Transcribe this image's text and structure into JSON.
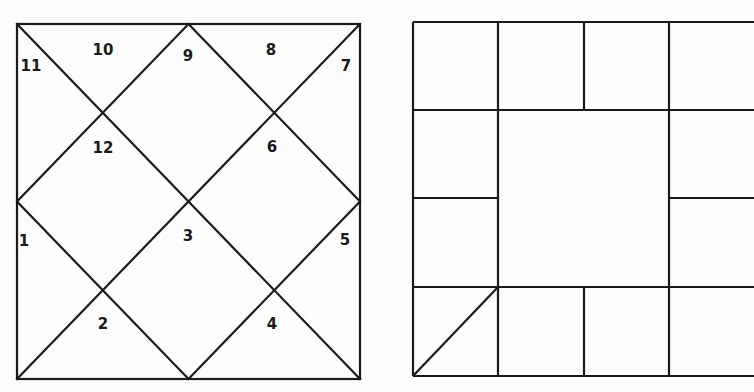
{
  "colors": {
    "line": "#1a1a1a",
    "background": "#fdfdfd"
  },
  "north_chart": {
    "style": "North Indian diamond chart",
    "box": {
      "x1": 17,
      "y1": 24,
      "x2": 360,
      "y2": 379
    },
    "houses": [
      {
        "number": "1",
        "x": 24,
        "y": 241
      },
      {
        "number": "2",
        "x": 103,
        "y": 324
      },
      {
        "number": "3",
        "x": 188,
        "y": 236
      },
      {
        "number": "4",
        "x": 272,
        "y": 324
      },
      {
        "number": "5",
        "x": 345,
        "y": 240
      },
      {
        "number": "6",
        "x": 272,
        "y": 147
      },
      {
        "number": "7",
        "x": 346,
        "y": 66
      },
      {
        "number": "8",
        "x": 271,
        "y": 50
      },
      {
        "number": "9",
        "x": 188,
        "y": 56
      },
      {
        "number": "10",
        "x": 103,
        "y": 50
      },
      {
        "number": "11",
        "x": 31,
        "y": 66
      },
      {
        "number": "12",
        "x": 103,
        "y": 148
      }
    ]
  },
  "south_chart": {
    "style": "South Indian square chart",
    "cols": [
      413,
      498,
      584,
      669,
      754
    ],
    "rows": [
      22,
      110,
      198,
      287,
      376
    ],
    "ascendant_marker": "diagonal in bottom-left cell"
  }
}
